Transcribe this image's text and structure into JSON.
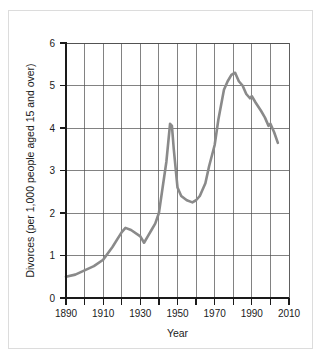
{
  "chart_data": {
    "type": "line",
    "title": "",
    "xlabel": "Year",
    "ylabel": "Divorces (per 1,000 people aged 15 and over)",
    "xlim": [
      1890,
      2010
    ],
    "ylim": [
      0,
      6
    ],
    "grid": true,
    "legend": "none",
    "x_tick_labels": [
      "1890",
      "1910",
      "1930",
      "1950",
      "1970",
      "1990",
      "2010"
    ],
    "x_tick_values": [
      1890,
      1910,
      1930,
      1950,
      1970,
      1990,
      2010
    ],
    "x_minor_tick_values": [
      1900,
      1920,
      1940,
      1960,
      1980,
      2000
    ],
    "y_tick_labels": [
      "0",
      "1",
      "2",
      "3",
      "4",
      "5",
      "6"
    ],
    "y_tick_values": [
      0,
      1,
      2,
      3,
      4,
      5,
      6
    ],
    "series": [
      {
        "name": "Divorce rate",
        "color": "#8a8a8a",
        "x": [
          1890,
          1895,
          1900,
          1905,
          1910,
          1915,
          1920,
          1922,
          1925,
          1930,
          1932,
          1934,
          1936,
          1938,
          1940,
          1942,
          1944,
          1946,
          1947,
          1948,
          1950,
          1952,
          1955,
          1958,
          1960,
          1962,
          1965,
          1967,
          1970,
          1972,
          1975,
          1977,
          1979,
          1981,
          1983,
          1985,
          1987,
          1989,
          1990,
          1992,
          1995,
          1997,
          1999,
          2000,
          2002,
          2004
        ],
        "y": [
          0.5,
          0.55,
          0.65,
          0.75,
          0.9,
          1.2,
          1.55,
          1.65,
          1.6,
          1.45,
          1.3,
          1.45,
          1.6,
          1.75,
          2.0,
          2.6,
          3.2,
          4.1,
          4.05,
          3.5,
          2.6,
          2.4,
          2.3,
          2.25,
          2.3,
          2.4,
          2.7,
          3.1,
          3.6,
          4.2,
          4.9,
          5.1,
          5.25,
          5.3,
          5.1,
          5.0,
          4.8,
          4.7,
          4.75,
          4.6,
          4.4,
          4.25,
          4.05,
          4.1,
          3.9,
          3.65
        ]
      }
    ]
  }
}
